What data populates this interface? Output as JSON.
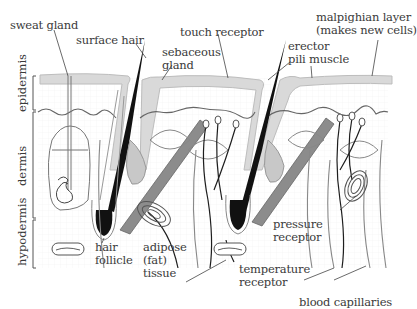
{
  "diagram": {
    "layers": [
      {
        "id": "epidermis",
        "label": "epidermis"
      },
      {
        "id": "dermis",
        "label": "dermis"
      },
      {
        "id": "hypodermis",
        "label": "hypodermis"
      }
    ],
    "labels": {
      "sweat_gland": "sweat gland",
      "surface_hair": "surface hair",
      "touch_receptor": "touch receptor",
      "sebaceous_gland_l1": "sebaceous",
      "sebaceous_gland_l2": "gland",
      "malpighian_l1": "malpighian layer",
      "malpighian_l2": "(makes new cells)",
      "erector_l1": "erector",
      "erector_l2": "pili muscle",
      "hair_follicle_l1": "hair",
      "hair_follicle_l2": "follicle",
      "adipose_l1": "adipose",
      "adipose_l2": "(fat)",
      "adipose_l3": "tissue",
      "pressure_l1": "pressure",
      "pressure_l2": "receptor",
      "temperature_l1": "temperature",
      "temperature_l2": "receptor",
      "blood_capillaries": "blood capillaries"
    },
    "colors": {
      "epidermis_fill": "#d9d9d9",
      "outline": "#8a8a8a",
      "hair": "#111111",
      "muscle": "#8c8c8c",
      "gland": "#c8c8c8",
      "nerve": "#1e1e1e",
      "text": "#3a3a3a"
    }
  }
}
